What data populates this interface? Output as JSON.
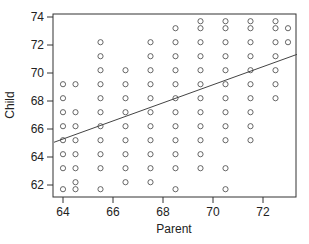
{
  "chart_data": {
    "type": "scatter",
    "title": "",
    "xlabel": "Parent",
    "ylabel": "Child",
    "xlim": [
      63.64,
      73.36
    ],
    "ylim": [
      61.3,
      74.1
    ],
    "xticks": [
      64,
      66,
      68,
      70,
      72
    ],
    "yticks": [
      62,
      64,
      66,
      68,
      70,
      72,
      74
    ],
    "grid": false,
    "legend": null,
    "marker": "open-circle",
    "points": [
      {
        "x": 64.0,
        "y": [
          69.2,
          68.2,
          67.2,
          66.2,
          65.2,
          64.2,
          63.2,
          61.7
        ]
      },
      {
        "x": 64.5,
        "y": [
          69.2,
          67.2,
          66.2,
          65.2,
          64.2,
          63.2,
          62.2,
          61.7
        ]
      },
      {
        "x": 65.5,
        "y": [
          72.2,
          71.2,
          70.2,
          69.2,
          68.2,
          67.2,
          66.2,
          65.2,
          64.2,
          63.2,
          61.7
        ]
      },
      {
        "x": 66.5,
        "y": [
          70.2,
          69.2,
          68.2,
          67.2,
          66.2,
          65.2,
          64.2,
          63.2,
          62.2
        ]
      },
      {
        "x": 67.5,
        "y": [
          72.2,
          71.2,
          70.2,
          69.2,
          68.2,
          67.2,
          66.2,
          65.2,
          64.2,
          63.2,
          62.2
        ]
      },
      {
        "x": 68.5,
        "y": [
          73.2,
          72.2,
          71.2,
          70.2,
          69.2,
          68.2,
          67.2,
          66.2,
          65.2,
          64.2,
          63.2,
          61.7
        ]
      },
      {
        "x": 69.5,
        "y": [
          73.7,
          73.2,
          72.2,
          71.2,
          70.2,
          69.2,
          68.2,
          67.2,
          66.2,
          65.2,
          64.2,
          63.2
        ]
      },
      {
        "x": 70.5,
        "y": [
          73.7,
          73.2,
          72.2,
          71.2,
          70.2,
          69.2,
          68.2,
          67.2,
          66.2,
          65.2,
          63.2,
          61.7
        ]
      },
      {
        "x": 71.5,
        "y": [
          73.7,
          73.2,
          72.2,
          71.2,
          70.2,
          69.2,
          68.2,
          67.2,
          66.2,
          65.2
        ]
      },
      {
        "x": 72.5,
        "y": [
          73.7,
          73.2,
          72.2,
          71.2,
          70.2,
          69.2,
          68.2
        ]
      },
      {
        "x": 73.0,
        "y": [
          73.2,
          72.2
        ]
      }
    ],
    "regression_line": {
      "intercept": 23.94,
      "slope": 0.646,
      "x_range": [
        63.64,
        73.36
      ]
    }
  },
  "layout": {
    "plot_left": 53,
    "plot_right": 296,
    "plot_top": 14,
    "plot_bottom": 197,
    "x0_value": 64,
    "x0_px": 63,
    "px_per_x": 25,
    "y0_value": 74,
    "y0_px": 17,
    "px_per_y": 14
  }
}
